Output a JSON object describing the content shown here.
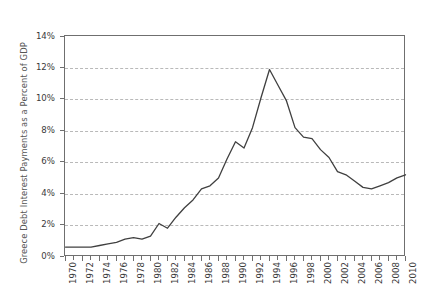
{
  "chart_data": {
    "type": "line",
    "title": "",
    "subtitle": "",
    "xlabel": "",
    "ylabel": "Greece Debt Interest Payments as a Percent of GDP",
    "xlim": [
      1970,
      2010
    ],
    "ylim": [
      0,
      14
    ],
    "grid": true,
    "grid_axis": "y",
    "legend": false,
    "legend_position": "none",
    "line_color": "#404040",
    "axis_color": "#6f6f6f",
    "gridline_color": "#b9b9b9",
    "y_tick_labels": [
      "0%",
      "2%",
      "4%",
      "6%",
      "8%",
      "10%",
      "12%",
      "14%"
    ],
    "y_tick_values": [
      0,
      2,
      4,
      6,
      8,
      10,
      12,
      14
    ],
    "x_tick_labels": [
      "1970",
      "1972",
      "1974",
      "1976",
      "1978",
      "1980",
      "1982",
      "1984",
      "1986",
      "1988",
      "1990",
      "1992",
      "1994",
      "1996",
      "1998",
      "2000",
      "2002",
      "2004",
      "2006",
      "2008",
      "2010"
    ],
    "x_tick_values": [
      1970,
      1972,
      1974,
      1976,
      1978,
      1980,
      1982,
      1984,
      1986,
      1988,
      1990,
      1992,
      1994,
      1996,
      1998,
      2000,
      2002,
      2004,
      2006,
      2008,
      2010
    ],
    "x_minor_ticks": [
      1971,
      1973,
      1975,
      1977,
      1979,
      1981,
      1983,
      1985,
      1987,
      1989,
      1991,
      1993,
      1995,
      1997,
      1999,
      2001,
      2003,
      2005,
      2007,
      2009
    ],
    "x": [
      1970,
      1971,
      1972,
      1973,
      1974,
      1975,
      1976,
      1977,
      1978,
      1979,
      1980,
      1981,
      1982,
      1983,
      1984,
      1985,
      1986,
      1987,
      1988,
      1989,
      1990,
      1991,
      1992,
      1993,
      1994,
      1995,
      1996,
      1997,
      1998,
      1999,
      2000,
      2001,
      2002,
      2003,
      2004,
      2005,
      2006,
      2007,
      2008,
      2009,
      2010
    ],
    "values": [
      0.6,
      0.6,
      0.6,
      0.6,
      0.7,
      0.8,
      0.9,
      1.1,
      1.2,
      1.1,
      1.3,
      2.1,
      1.8,
      2.5,
      3.1,
      3.6,
      4.3,
      4.5,
      5.0,
      6.2,
      7.3,
      6.9,
      8.2,
      10.1,
      11.9,
      10.9,
      9.9,
      8.2,
      7.6,
      7.5,
      6.8,
      6.3,
      5.4,
      5.2,
      4.8,
      4.4,
      4.3,
      4.5,
      4.7,
      5.0,
      5.2
    ],
    "series_name": "Greece Debt Interest Payments as a Percent of GDP"
  }
}
